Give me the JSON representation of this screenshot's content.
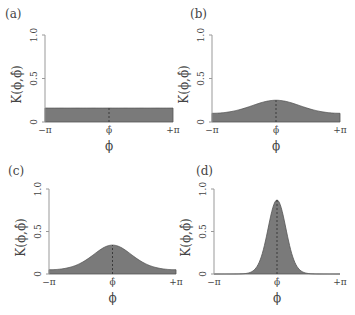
{
  "figure": {
    "colors": {
      "fill": "#7a7a7a",
      "stroke": "#555555",
      "axis": "#999999",
      "text": "#444444",
      "dashed": "#333333"
    }
  },
  "chart_data": [
    {
      "panel": "(a)",
      "type": "area",
      "title": "",
      "ylabel": "K(ϕ,ϕ̂)",
      "xlabel": "ϕ",
      "xticks": [
        "−π",
        "ϕ̂",
        "+π"
      ],
      "yticks": [
        "0",
        "0.5",
        "1.0"
      ],
      "ylim": [
        0,
        1.0
      ],
      "xlim": [
        -3.1416,
        3.1416
      ],
      "shape": "uniform",
      "peak": 0.16,
      "edge": 0.16,
      "kappa": 0
    },
    {
      "panel": "(b)",
      "type": "area",
      "ylabel": "K(ϕ,ϕ̂)",
      "xlabel": "ϕ",
      "xticks": [
        "−π",
        "ϕ̂",
        "+π"
      ],
      "yticks": [
        "0",
        "0.5",
        "1.0"
      ],
      "ylim": [
        0,
        1.0
      ],
      "xlim": [
        -3.1416,
        3.1416
      ],
      "shape": "von_mises",
      "peak": 0.25,
      "edge": 0.1,
      "kappa": 0.5
    },
    {
      "panel": "(c)",
      "type": "area",
      "ylabel": "K(ϕ,ϕ̂)",
      "xlabel": "ϕ",
      "xticks": [
        "−π",
        "ϕ̂",
        "+π"
      ],
      "yticks": [
        "0",
        "0.5",
        "1.0"
      ],
      "ylim": [
        0,
        1.0
      ],
      "xlim": [
        -3.1416,
        3.1416
      ],
      "shape": "von_mises",
      "peak": 0.34,
      "edge": 0.05,
      "kappa": 1.0
    },
    {
      "panel": "(d)",
      "type": "area",
      "ylabel": "K(ϕ,ϕ̂)",
      "xlabel": "ϕ",
      "xticks": [
        "−π",
        "ϕ̂",
        "+π"
      ],
      "yticks": [
        "0",
        "0.5",
        "1.0"
      ],
      "ylim": [
        0,
        1.0
      ],
      "xlim": [
        -3.1416,
        3.1416
      ],
      "shape": "von_mises",
      "peak": 0.87,
      "edge": 0.0,
      "kappa": 5.0
    }
  ],
  "layout": [
    {
      "label_x": 5,
      "label_y": 18,
      "axis_x": 45,
      "right_x": 173,
      "top_y": 35,
      "base_y": 122
    },
    {
      "label_x": 190,
      "label_y": 18,
      "axis_x": 212,
      "right_x": 340,
      "top_y": 35,
      "base_y": 122
    },
    {
      "label_x": 8,
      "label_y": 175,
      "axis_x": 49,
      "right_x": 176,
      "top_y": 189,
      "base_y": 274
    },
    {
      "label_x": 196,
      "label_y": 175,
      "axis_x": 214,
      "right_x": 340,
      "top_y": 189,
      "base_y": 274
    }
  ]
}
